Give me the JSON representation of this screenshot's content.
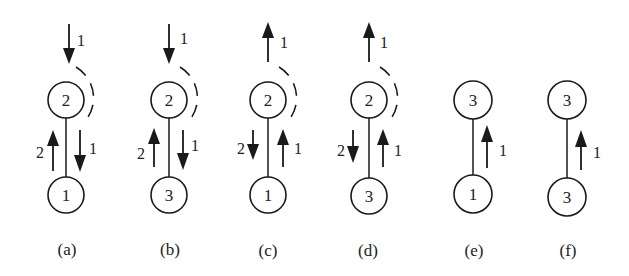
{
  "diagram": {
    "node_radius": 18,
    "top_y": 100,
    "bottom_y": 195,
    "label_y": 249,
    "panels": [
      {
        "id": "a",
        "label": "(a)",
        "cx": 66,
        "top_node": "2",
        "bottom_node": "1",
        "incoming": {
          "direction": "down",
          "label": "1"
        },
        "dashed_arc": true,
        "left_arrow": {
          "direction": "up",
          "label": "2"
        },
        "right_arrow": {
          "direction": "down",
          "label": "1"
        }
      },
      {
        "id": "b",
        "label": "(b)",
        "cx": 169,
        "top_node": "2",
        "bottom_node": "3",
        "incoming": {
          "direction": "down",
          "label": "1"
        },
        "dashed_arc": true,
        "left_arrow": {
          "direction": "up",
          "label": "2"
        },
        "right_arrow": {
          "direction": "down",
          "label": "1"
        }
      },
      {
        "id": "c",
        "label": "(c)",
        "cx": 268,
        "top_node": "2",
        "bottom_node": "1",
        "incoming": {
          "direction": "up",
          "label": "1"
        },
        "dashed_arc": true,
        "left_arrow": {
          "direction": "down",
          "label": "2"
        },
        "right_arrow": {
          "direction": "up",
          "label": "1"
        }
      },
      {
        "id": "d",
        "label": "(d)",
        "cx": 369,
        "top_node": "2",
        "bottom_node": "3",
        "incoming": {
          "direction": "up",
          "label": "1"
        },
        "dashed_arc": true,
        "left_arrow": {
          "direction": "down",
          "label": "2"
        },
        "right_arrow": {
          "direction": "up",
          "label": "1"
        }
      },
      {
        "id": "e",
        "label": "(e)",
        "cx": 473,
        "top_node": "3",
        "bottom_node": "1",
        "incoming": null,
        "dashed_arc": false,
        "left_arrow": null,
        "right_arrow": {
          "direction": "up",
          "label": "1"
        }
      },
      {
        "id": "f",
        "label": "(f)",
        "cx": 567,
        "top_node": "3",
        "bottom_node": "3",
        "incoming": null,
        "dashed_arc": false,
        "left_arrow": null,
        "right_arrow": {
          "direction": "up",
          "label": "1"
        }
      }
    ]
  }
}
